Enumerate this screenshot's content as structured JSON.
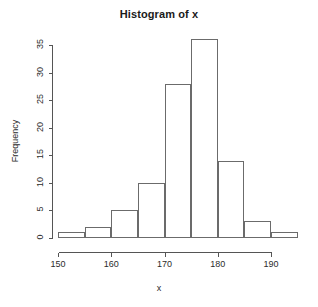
{
  "chart_data": {
    "type": "bar",
    "title": "Histogram of x",
    "xlabel": "x",
    "ylabel": "Frequency",
    "bin_width": 5,
    "bin_edges": [
      150,
      155,
      160,
      165,
      170,
      175,
      180,
      185,
      190,
      195
    ],
    "categories": [
      "150-155",
      "155-160",
      "160-165",
      "165-170",
      "170-175",
      "175-180",
      "180-185",
      "185-190",
      "190-195"
    ],
    "values": [
      1,
      2,
      5,
      10,
      28,
      36,
      14,
      3,
      1
    ],
    "xlim": [
      150,
      195
    ],
    "ylim": [
      0,
      36
    ],
    "x_ticks": [
      150,
      160,
      170,
      180,
      190
    ],
    "x_tick_labels": [
      "150",
      "160",
      "170",
      "180",
      "190"
    ],
    "y_ticks": [
      0,
      5,
      10,
      15,
      20,
      25,
      30,
      35
    ],
    "y_tick_labels": [
      "0",
      "5",
      "10",
      "15",
      "20",
      "25",
      "30",
      "35"
    ],
    "grid": false,
    "legend": null,
    "bar_fill_color": "#ffffff",
    "bar_stroke_color": "#6b6b6b",
    "axis_color": "#555555",
    "background_color": "#ffffff",
    "text_color": "#2b2b2b",
    "title_color": "#1a1a1a"
  }
}
